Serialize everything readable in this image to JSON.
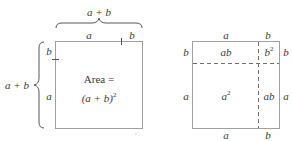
{
  "left_figure": {
    "top_brace_label": "a + b",
    "left_brace_label": "a + b",
    "top_side_labels": [
      "a",
      "b"
    ],
    "left_side_labels": [
      "b",
      "a"
    ],
    "area_label_line1": "Area =",
    "area_label_line2_base": "(a + b)",
    "area_label_line2_exp": "2"
  },
  "right_figure": {
    "top_labels": [
      "a",
      "b"
    ],
    "bottom_labels": [
      "a",
      "b"
    ],
    "left_labels": [
      "b",
      "a"
    ],
    "right_labels": [
      "b",
      "a"
    ],
    "regions": {
      "top_left": "ab",
      "top_right_base": "b",
      "top_right_exp": "2",
      "bottom_left_base": "a",
      "bottom_left_exp": "2",
      "bottom_right": "ab"
    }
  },
  "colors": {
    "line": "#a0a0a0",
    "dash": "#707070",
    "text": "#3a3a3a"
  }
}
